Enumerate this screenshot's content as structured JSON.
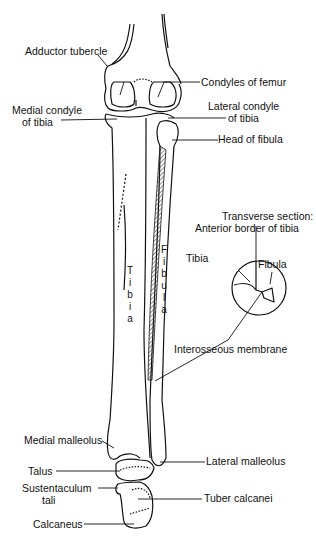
{
  "figure": {
    "labels": {
      "adductor_tubercle": "Adductor tubercle",
      "condyles_of_femur": "Condyles of femur",
      "medial_condyle_l1": "Medial condyle",
      "medial_condyle_l2": "of tibia",
      "lateral_condyle_l1": "Lateral condyle",
      "lateral_condyle_l2": "of tibia",
      "head_of_fibula": "Head of fibula",
      "transverse_l1": "Transverse section:",
      "transverse_l2": "Anterior border of tibia",
      "section_tibia": "Tibia",
      "section_fibula": "Fibula",
      "interosseous_membrane": "Interosseous membrane",
      "medial_malleolus": "Medial malleolus",
      "lateral_malleolus": "Lateral malleolus",
      "talus": "Talus",
      "sustentaculum_l1": "Sustentaculum",
      "sustentaculum_l2": "tali",
      "tuber_calcanei": "Tuber calcanei",
      "calcaneus": "Calcaneus"
    },
    "bone_text": {
      "tibia": [
        "T",
        "i",
        "b",
        "i",
        "a"
      ],
      "fibula": [
        "F",
        "i",
        "b",
        "u",
        "l",
        "a"
      ]
    }
  }
}
